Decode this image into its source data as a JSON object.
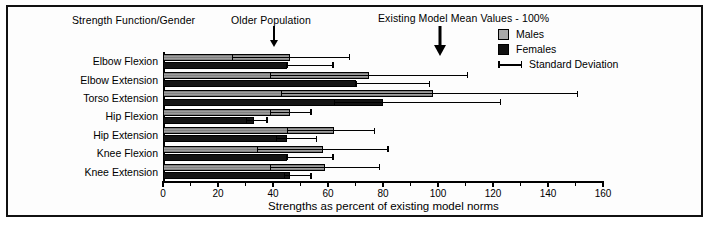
{
  "annotations": {
    "strength_function_gender": "Strength Function/Gender",
    "older_population": "Older Population",
    "existing_model": "Existing Model Mean Values - 100%"
  },
  "legend": {
    "items": [
      {
        "label": "Males",
        "marker": "square",
        "color": "#9d9d9d"
      },
      {
        "label": "Females",
        "marker": "square",
        "color": "#141414"
      },
      {
        "label": "Standard Deviation",
        "marker": "errorbar",
        "color": "#000000"
      }
    ]
  },
  "chart_data": {
    "type": "bar",
    "orientation": "horizontal",
    "title": "",
    "xlabel": "Strengths as percent of existing model norms",
    "ylabel": "Strength Function/Gender",
    "xlim": [
      0,
      160
    ],
    "xticks": [
      0,
      20,
      40,
      60,
      80,
      100,
      120,
      140,
      160
    ],
    "xticklabels": [
      "0",
      "20",
      "40",
      "60",
      "80",
      "100",
      "120",
      "140",
      "160"
    ],
    "minor_ticks": [
      10,
      30,
      50,
      70,
      90,
      110,
      130,
      150
    ],
    "grid": false,
    "legend_position": "top-right",
    "categories": [
      "Elbow Flexion",
      "Elbow Extension",
      "Torso Extension",
      "Hip Flexion",
      "Hip Extension",
      "Knee Flexion",
      "Knee Extension"
    ],
    "series": [
      {
        "name": "Males",
        "color": "#9d9d9d",
        "values": [
          46,
          75,
          98,
          46,
          62,
          58,
          59
        ],
        "std_low": [
          25,
          39,
          43,
          39,
          45,
          34,
          39
        ],
        "std_high": [
          68,
          111,
          151,
          54,
          77,
          82,
          79
        ]
      },
      {
        "name": "Females",
        "color": "#141414",
        "values": [
          45,
          70,
          80,
          33,
          45,
          45,
          46
        ],
        "std_low": [
          45,
          70,
          62,
          30,
          41,
          45,
          44
        ],
        "std_high": [
          62,
          97,
          123,
          38,
          56,
          62,
          54
        ]
      }
    ],
    "reference_markers": [
      {
        "label": "Older Population",
        "x": 40
      },
      {
        "label": "Existing Model Mean Values - 100%",
        "x": 100
      }
    ]
  }
}
